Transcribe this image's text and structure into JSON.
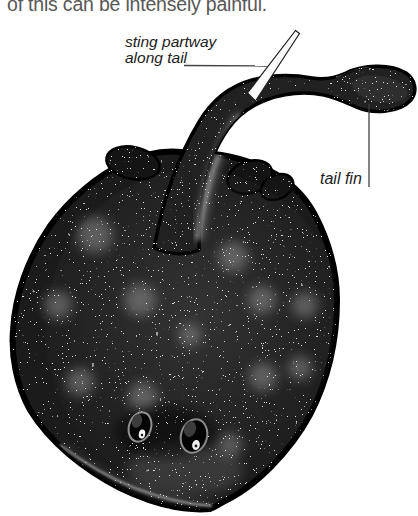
{
  "page": {
    "top_text_fragment": "of this can be intensely painful."
  },
  "figure": {
    "labels": {
      "sting_line1": "sting partway",
      "sting_line2": "along tail",
      "tail_fin": "tail fin"
    },
    "colors": {
      "background": "#ffffff",
      "body_ink": "#1b1b1b",
      "speckles": "#ffffff",
      "label_text": "#1c1c1c",
      "fragment_text": "#585858",
      "leader_line": "#404040",
      "sting_fill": "#fafafa"
    }
  }
}
